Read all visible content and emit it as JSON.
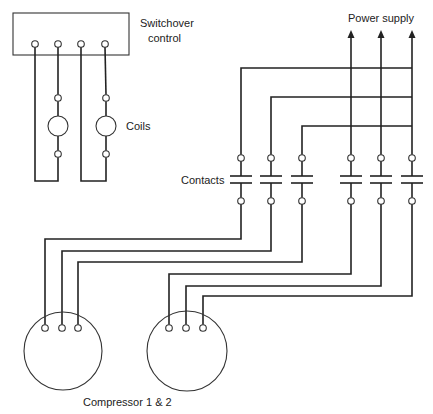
{
  "diagram": {
    "labels": {
      "switchover": [
        "Switchover",
        "control"
      ],
      "coils": "Coils",
      "contacts": "Contacts",
      "power_supply": "Power supply",
      "compressors": "Compressor 1 & 2"
    },
    "components": {
      "switchover_control": {
        "terminals": 4
      },
      "coils": {
        "count": 2
      },
      "contacts": {
        "count": 6,
        "groups": [
          "compressor-1-contacts",
          "compressor-2-contacts"
        ]
      },
      "power_supply": {
        "lines": 3
      },
      "compressors": [
        {
          "name": "Compressor 1",
          "terminals": 3
        },
        {
          "name": "Compressor 2",
          "terminals": 3
        }
      ]
    },
    "colors": {
      "ink": "#222222",
      "background": "#ffffff"
    }
  }
}
